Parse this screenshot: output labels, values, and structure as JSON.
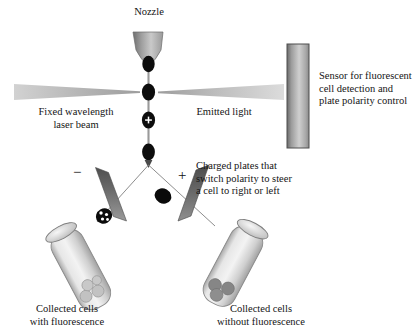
{
  "diagram": {
    "title_implicit": "Fluorescence-activated cell sorting (FACS) schematic",
    "labels": {
      "nozzle": "Nozzle",
      "laser": "Fixed wavelength\nlaser beam",
      "emitted": "Emitted light",
      "sensor": "Sensor for fluorescent\ncell detection and\nplate polarity control",
      "plates": "Charged plates that\nswitch polarity to steer\na cell to right or left",
      "collected_left": "Collected cells\nwith fluorescence",
      "collected_right": "Collected cells\nwithout fluorescence",
      "plate_negative": "−",
      "plate_positive": "+",
      "droplet_charge": "+"
    },
    "icons": {
      "nozzle": "nozzle-funnel-icon",
      "laser_beam": "laser-wedge-icon",
      "emitted_light": "emitted-light-wedge-icon",
      "sensor": "sensor-bar-icon",
      "plate_left": "charged-plate-negative-icon",
      "plate_right": "charged-plate-positive-icon",
      "tube_left": "collection-tube-icon",
      "tube_right": "collection-tube-icon",
      "droplet": "droplet-icon",
      "fluorescent_cell": "fluorescent-cell-icon"
    },
    "colors": {
      "stream": "#8c8c8c",
      "droplet": "#0d0d0d",
      "plate_dark": "#5e5e5e",
      "plate_light": "#8f8f8f",
      "beam": "#b9b9b9",
      "sensor_dark": "#5a5a5a",
      "sensor_light": "#d8d8d8",
      "tube_body": "#cfcfcf",
      "cell_gray": "#808080",
      "text": "#141414",
      "background": "#ffffff"
    },
    "geometry": {
      "stream_x": 148,
      "droplet_y": [
        64,
        92,
        120,
        152
      ],
      "charged_droplet_index": 2,
      "beam_axis_y": 92,
      "split_y": 160
    }
  }
}
